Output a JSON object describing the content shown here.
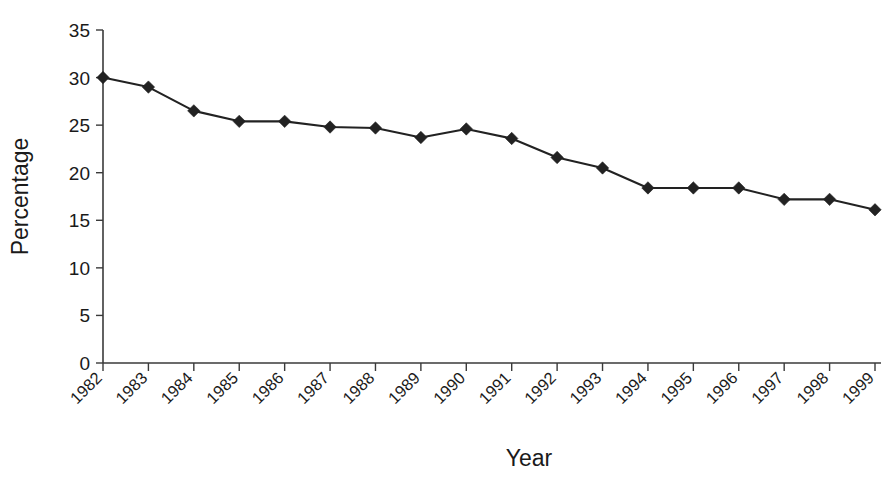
{
  "chart_data": {
    "type": "line",
    "title": "",
    "xlabel": "Year",
    "ylabel": "Percentage",
    "categories": [
      "1982",
      "1983",
      "1984",
      "1985",
      "1986",
      "1987",
      "1988",
      "1989",
      "1990",
      "1991",
      "1992",
      "1993",
      "1994",
      "1995",
      "1996",
      "1997",
      "1998",
      "1999"
    ],
    "values": [
      30.0,
      29.0,
      26.5,
      25.4,
      25.4,
      24.8,
      24.7,
      23.7,
      24.6,
      23.6,
      21.6,
      20.5,
      18.4,
      18.4,
      18.4,
      17.2,
      17.2,
      16.1
    ],
    "series": [
      {
        "name": "Percentage",
        "values": [
          30.0,
          29.0,
          26.5,
          25.4,
          25.4,
          24.8,
          24.7,
          23.7,
          24.6,
          23.6,
          21.6,
          20.5,
          18.4,
          18.4,
          18.4,
          17.2,
          17.2,
          16.1
        ]
      }
    ],
    "ylim": [
      0,
      35
    ],
    "yticks": [
      0,
      5,
      10,
      15,
      20,
      25,
      30,
      35
    ],
    "ytick_labels": [
      "0",
      "5",
      "10",
      "15",
      "20",
      "25",
      "30",
      "35"
    ],
    "grid": false,
    "legend": false,
    "legend_position": "none",
    "marker": "diamond",
    "line_color": "#222222",
    "marker_color": "#222222",
    "background_color": "#ffffff",
    "xtick_rotation_deg": 45
  }
}
